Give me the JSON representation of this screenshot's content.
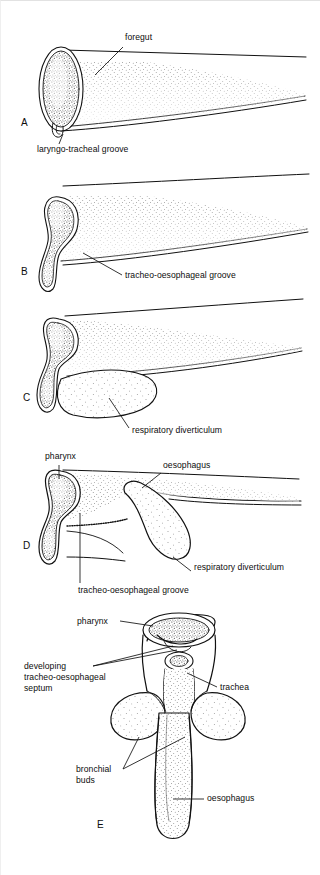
{
  "figure": {
    "ink_color": "#111111",
    "background_color": "#ffffff",
    "panel_count": 5
  },
  "panels": [
    {
      "id": "A",
      "letter": "A",
      "labels": [
        {
          "name": "foregut",
          "text": "foregut"
        },
        {
          "name": "laryngo-tracheal-groove",
          "text": "laryngo-tracheal groove"
        }
      ]
    },
    {
      "id": "B",
      "letter": "B",
      "labels": [
        {
          "name": "tracheo-oesophageal-groove",
          "text": "tracheo-oesophageal groove"
        }
      ]
    },
    {
      "id": "C",
      "letter": "C",
      "labels": [
        {
          "name": "respiratory-diverticulum",
          "text": "respiratory diverticulum"
        }
      ]
    },
    {
      "id": "D",
      "letter": "D",
      "labels": [
        {
          "name": "pharynx",
          "text": "pharynx"
        },
        {
          "name": "oesophagus",
          "text": "oesophagus"
        },
        {
          "name": "respiratory-diverticulum",
          "text": "respiratory diverticulum"
        },
        {
          "name": "tracheo-oesophageal-groove",
          "text": "tracheo-oesophageal groove"
        }
      ]
    },
    {
      "id": "E",
      "letter": "E",
      "labels": [
        {
          "name": "pharynx",
          "text": "pharynx"
        },
        {
          "name": "developing-septum",
          "text": "developing tracheo-oesophageal septum"
        },
        {
          "name": "developing-septum-line1",
          "text": "developing"
        },
        {
          "name": "developing-septum-line2",
          "text": "tracheo-oesophageal"
        },
        {
          "name": "developing-septum-line3",
          "text": "septum"
        },
        {
          "name": "trachea",
          "text": "trachea"
        },
        {
          "name": "bronchial-buds-line1",
          "text": "bronchial"
        },
        {
          "name": "bronchial-buds-line2",
          "text": "buds"
        },
        {
          "name": "oesophagus",
          "text": "oesophagus"
        }
      ]
    }
  ]
}
